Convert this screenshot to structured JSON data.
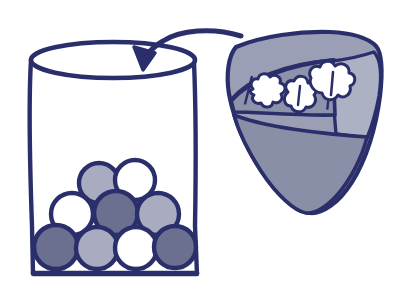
{
  "illustration": {
    "title": "Pouring seeds from a scoop into a bag",
    "background_color": "#ffffff",
    "stroke_color": "#2a2f6b",
    "stroke_color_soft": "#343a78",
    "palette": {
      "navy": "#2a2f6b",
      "white": "#ffffff",
      "light_gray": "#a9acc1",
      "mid_gray": "#8f93ab",
      "dark_gray": "#6b7090",
      "cone_body": "#9b9fb6",
      "cone_panel_light": "#adb1c4",
      "cone_panel_dark": "#8a8fa8",
      "cone_inner": "#8e93ac"
    }
  },
  "bag": {
    "name": "paper bag container",
    "rim_label": "open elliptical rim",
    "wall_left_label": "left wall",
    "wall_right_label": "right wall",
    "base_label": "flat base"
  },
  "discs": {
    "label": "seed discs inside the bag",
    "count": 9,
    "rows": [
      {
        "row_index": 1,
        "items": [
          {
            "id": "disc-r1-c1",
            "cx": 99,
            "cy": 183,
            "r": 20,
            "fill_key": "light_gray"
          },
          {
            "id": "disc-r1-c2",
            "cx": 135,
            "cy": 180,
            "r": 20,
            "fill_key": "white"
          }
        ]
      },
      {
        "row_index": 2,
        "items": [
          {
            "id": "disc-r2-c1",
            "cx": 72,
            "cy": 214,
            "r": 21,
            "fill_key": "white"
          },
          {
            "id": "disc-r2-c2",
            "cx": 116,
            "cy": 213,
            "r": 22,
            "fill_key": "dark_gray"
          },
          {
            "id": "disc-r2-c3",
            "cx": 158,
            "cy": 214,
            "r": 21,
            "fill_key": "light_gray"
          }
        ]
      },
      {
        "row_index": 3,
        "items": [
          {
            "id": "disc-r3-c1",
            "cx": 56,
            "cy": 247,
            "r": 22,
            "fill_key": "dark_gray"
          },
          {
            "id": "disc-r3-c2",
            "cx": 97,
            "cy": 248,
            "r": 21,
            "fill_key": "light_gray"
          },
          {
            "id": "disc-r3-c3",
            "cx": 136,
            "cy": 248,
            "r": 21,
            "fill_key": "white"
          },
          {
            "id": "disc-r3-c4",
            "cx": 175,
            "cy": 247,
            "r": 21,
            "fill_key": "dark_gray"
          }
        ]
      }
    ]
  },
  "scoop": {
    "name": "scoop of popped seeds",
    "body_label": "scoop body",
    "panel_right_label": "right panel",
    "panel_lower_label": "lower panel",
    "inner_label": "inner compartment",
    "kernels": [
      {
        "id": "kernel-left",
        "label": "popped kernel left"
      },
      {
        "id": "kernel-center",
        "label": "popped kernel center"
      },
      {
        "id": "kernel-right",
        "label": "popped kernel right"
      }
    ]
  },
  "arrow": {
    "name": "pour arrow",
    "direction": "from scoop to bag opening",
    "head_label": "arrowhead"
  }
}
